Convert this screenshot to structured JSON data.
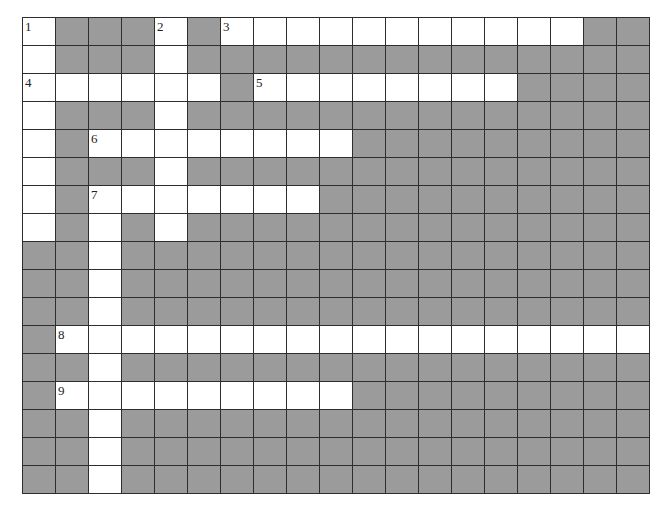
{
  "puzzle": {
    "cols": 19,
    "rows": 17,
    "colors": {
      "open_cell": "#ffffff",
      "blocked_cell": "#9b9b9b",
      "grid_line": "#2e2e2e"
    },
    "open_cells": [
      [
        0,
        0
      ],
      [
        0,
        4
      ],
      [
        0,
        6
      ],
      [
        0,
        7
      ],
      [
        0,
        8
      ],
      [
        0,
        9
      ],
      [
        0,
        10
      ],
      [
        0,
        11
      ],
      [
        0,
        12
      ],
      [
        0,
        13
      ],
      [
        0,
        14
      ],
      [
        0,
        15
      ],
      [
        0,
        16
      ],
      [
        1,
        0
      ],
      [
        1,
        4
      ],
      [
        2,
        0
      ],
      [
        2,
        1
      ],
      [
        2,
        2
      ],
      [
        2,
        3
      ],
      [
        2,
        4
      ],
      [
        2,
        5
      ],
      [
        2,
        7
      ],
      [
        2,
        8
      ],
      [
        2,
        9
      ],
      [
        2,
        10
      ],
      [
        2,
        11
      ],
      [
        2,
        12
      ],
      [
        2,
        13
      ],
      [
        2,
        14
      ],
      [
        3,
        0
      ],
      [
        3,
        4
      ],
      [
        4,
        0
      ],
      [
        4,
        2
      ],
      [
        4,
        3
      ],
      [
        4,
        4
      ],
      [
        4,
        5
      ],
      [
        4,
        6
      ],
      [
        4,
        7
      ],
      [
        4,
        8
      ],
      [
        4,
        9
      ],
      [
        5,
        0
      ],
      [
        5,
        4
      ],
      [
        6,
        0
      ],
      [
        6,
        2
      ],
      [
        6,
        3
      ],
      [
        6,
        4
      ],
      [
        6,
        5
      ],
      [
        6,
        6
      ],
      [
        6,
        7
      ],
      [
        6,
        8
      ],
      [
        7,
        0
      ],
      [
        7,
        2
      ],
      [
        7,
        4
      ],
      [
        8,
        2
      ],
      [
        9,
        2
      ],
      [
        10,
        2
      ],
      [
        11,
        1
      ],
      [
        11,
        2
      ],
      [
        11,
        3
      ],
      [
        11,
        4
      ],
      [
        11,
        5
      ],
      [
        11,
        6
      ],
      [
        11,
        7
      ],
      [
        11,
        8
      ],
      [
        11,
        9
      ],
      [
        11,
        10
      ],
      [
        11,
        11
      ],
      [
        11,
        12
      ],
      [
        11,
        13
      ],
      [
        11,
        14
      ],
      [
        11,
        15
      ],
      [
        11,
        16
      ],
      [
        11,
        17
      ],
      [
        11,
        18
      ],
      [
        12,
        2
      ],
      [
        13,
        1
      ],
      [
        13,
        2
      ],
      [
        13,
        3
      ],
      [
        13,
        4
      ],
      [
        13,
        5
      ],
      [
        13,
        6
      ],
      [
        13,
        7
      ],
      [
        13,
        8
      ],
      [
        13,
        9
      ],
      [
        14,
        2
      ],
      [
        15,
        2
      ],
      [
        16,
        2
      ]
    ],
    "numbers": [
      {
        "row": 0,
        "col": 0,
        "label": "1"
      },
      {
        "row": 0,
        "col": 4,
        "label": "2"
      },
      {
        "row": 0,
        "col": 6,
        "label": "3"
      },
      {
        "row": 2,
        "col": 0,
        "label": "4"
      },
      {
        "row": 2,
        "col": 7,
        "label": "5"
      },
      {
        "row": 4,
        "col": 2,
        "label": "6"
      },
      {
        "row": 6,
        "col": 2,
        "label": "7"
      },
      {
        "row": 11,
        "col": 1,
        "label": "8"
      },
      {
        "row": 13,
        "col": 1,
        "label": "9"
      }
    ],
    "entries": {
      "across": [
        {
          "number": "3",
          "row": 0,
          "col": 6,
          "length": 11
        },
        {
          "number": "4",
          "row": 2,
          "col": 0,
          "length": 6
        },
        {
          "number": "5",
          "row": 2,
          "col": 7,
          "length": 8
        },
        {
          "number": "6",
          "row": 4,
          "col": 2,
          "length": 8
        },
        {
          "number": "7",
          "row": 6,
          "col": 2,
          "length": 7
        },
        {
          "number": "8",
          "row": 11,
          "col": 1,
          "length": 18
        },
        {
          "number": "9",
          "row": 13,
          "col": 1,
          "length": 9
        }
      ],
      "down": [
        {
          "number": "1",
          "row": 0,
          "col": 0,
          "length": 8
        },
        {
          "number": "2",
          "row": 0,
          "col": 4,
          "length": 8
        },
        {
          "number": "7",
          "row": 6,
          "col": 2,
          "length": 11
        }
      ]
    }
  }
}
